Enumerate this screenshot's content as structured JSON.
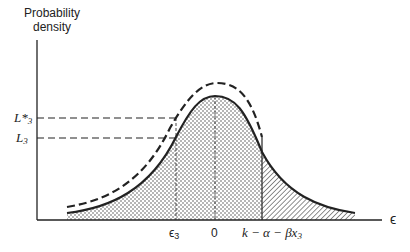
{
  "diagram": {
    "y_axis_label_line1": "Probability",
    "y_axis_label_line2": "density",
    "x_axis_label": "ϵ",
    "y_ticks": [
      {
        "id": "L_star_3",
        "base": "L*",
        "sub": "3"
      },
      {
        "id": "L_3",
        "base": "L",
        "sub": "3"
      }
    ],
    "x_ticks": [
      {
        "id": "eps3",
        "base": "ϵ",
        "sub": "3"
      },
      {
        "id": "zero",
        "text": "0"
      },
      {
        "id": "threshold",
        "text": "k − α − βx",
        "sub": "3"
      }
    ],
    "curves": [
      {
        "name": "density",
        "style": "solid"
      },
      {
        "name": "truncated-density",
        "style": "dashed"
      }
    ],
    "regions": [
      {
        "name": "below-threshold",
        "fill": "dotted"
      },
      {
        "name": "above-threshold",
        "fill": "hatched"
      }
    ],
    "colors": {
      "ink": "#222222",
      "background": "#ffffff"
    }
  }
}
